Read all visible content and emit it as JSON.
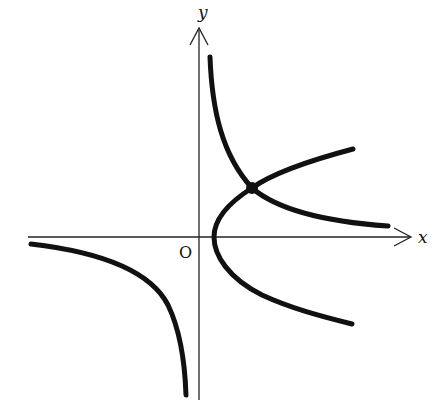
{
  "diagram": {
    "axes": {
      "x_label": "x",
      "y_label": "y",
      "origin_label": "O"
    },
    "curves": [
      {
        "name": "hyperbola",
        "branches": [
          "first-quadrant",
          "third-quadrant"
        ]
      },
      {
        "name": "parabola",
        "opening": "right",
        "vertex": "on positive x-axis"
      }
    ],
    "intersection_point": {
      "marked": true,
      "quadrant": "first"
    },
    "colors": {
      "stroke": "#111111",
      "background": "#ffffff"
    }
  }
}
